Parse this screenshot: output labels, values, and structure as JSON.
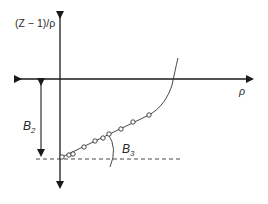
{
  "diagram": {
    "y_axis_label": "(Z − 1)/ρ",
    "x_axis_label": "ρ",
    "intercept_label": "B",
    "intercept_subscript": "2",
    "slope_label": "B",
    "slope_subscript": "3",
    "colors": {
      "axis": "#1a1a1a",
      "curve": "#333333",
      "points": "#333333",
      "dashed": "#333333"
    },
    "points": [
      {
        "x": 62,
        "y": 157
      },
      {
        "x": 69,
        "y": 155
      },
      {
        "x": 73,
        "y": 154
      },
      {
        "x": 84,
        "y": 147
      },
      {
        "x": 95,
        "y": 141
      },
      {
        "x": 103,
        "y": 138
      },
      {
        "x": 109,
        "y": 134
      },
      {
        "x": 121,
        "y": 129
      },
      {
        "x": 133,
        "y": 122
      },
      {
        "x": 149,
        "y": 115
      }
    ]
  }
}
